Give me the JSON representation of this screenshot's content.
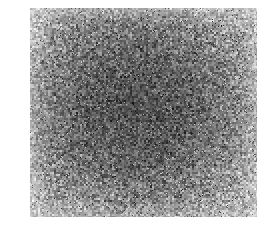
{
  "image": {
    "kind": "grayscale-speckle-micrograph",
    "description": "Dense fine-grained grayscale noise texture filling a rectangular plate",
    "caption": "",
    "label": "",
    "scale_bar": "",
    "annotations": [],
    "plate": {
      "left": 30,
      "top": 8,
      "width": 227,
      "height": 209
    },
    "canvas": {
      "width": 274,
      "height": 227
    },
    "appearance": {
      "background_color": "#ffffff",
      "mean_gray": "#8a8a8a",
      "darkest_gray": "#1a1a1a",
      "lightest_gray": "#f0f0f0",
      "center_tone": "#6f6f6f",
      "edge_tone": "#a8a8a8",
      "grain_size_px": 2,
      "contrast": "high",
      "vignette": "dark-center"
    }
  }
}
